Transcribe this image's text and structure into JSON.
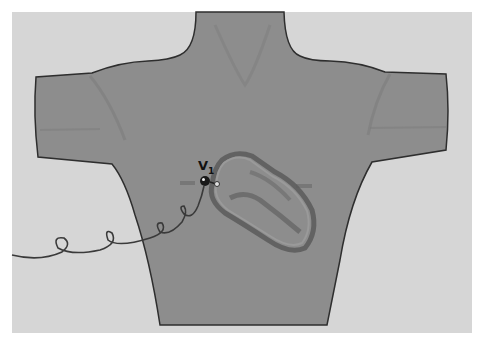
{
  "diagram": {
    "electrode": {
      "label": "V",
      "subscript": "1"
    },
    "colors": {
      "background": "#d6d6d6",
      "torso_fill": "#8d8d8d",
      "outline": "#2e2e2e",
      "heart_wall": "#9a9a9a",
      "electrode": "#1a1a1a",
      "cable": "#3a3a3a"
    }
  }
}
